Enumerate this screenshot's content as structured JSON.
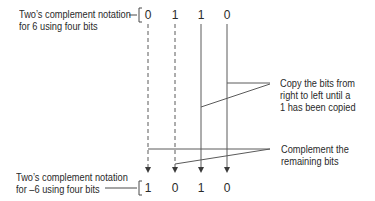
{
  "diagram": {
    "type": "twos-complement-conversion",
    "top_label": {
      "line1": "Two’s complement notation",
      "line2": "for 6 using four bits"
    },
    "bottom_label": {
      "line1": "Two’s complement notation",
      "line2": "for –6 using four bits"
    },
    "top_bits": [
      "0",
      "1",
      "1",
      "0"
    ],
    "bottom_bits": [
      "1",
      "0",
      "1",
      "0"
    ],
    "annotation_copy": {
      "line1": "Copy the bits from",
      "line2": "right to left until a",
      "line3": "1 has been copied"
    },
    "annotation_complement": {
      "line1": "Complement the",
      "line2": "remaining bits"
    },
    "colors": {
      "text": "#2a2a2a",
      "lines": "#5a5a5a"
    }
  }
}
